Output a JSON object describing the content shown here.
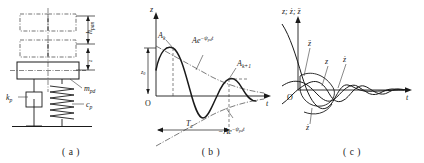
{
  "figure": {
    "panels": [
      {
        "id": "a",
        "caption": "( a )",
        "name": "pantograph-lumped-mass-model",
        "labels": {
          "height_dim": "h",
          "height_dim_sub": "pan",
          "small_dim": "z",
          "mass": "m",
          "mass_sub": "pd",
          "stiffness": "k",
          "stiffness_sub": "p",
          "damping": "c",
          "damping_sub": "p"
        },
        "elements": {
          "contact_wire_grid": "dash-dot catenary grid",
          "mass_block": "pantograph head mass block",
          "spring": "coil spring",
          "damper": "viscous damper",
          "ground": "base line"
        }
      },
      {
        "id": "b",
        "caption": "( b )",
        "name": "damped-free-vibration-response",
        "axes": {
          "y_label": "z",
          "x_label": "t",
          "origin_label": "O"
        },
        "labels": {
          "initial_amplitude": "z",
          "initial_amplitude_sub": "0",
          "peak_k": "A",
          "peak_k_sub": "k",
          "peak_k1": "A",
          "peak_k1_sub": "k+1",
          "upper_envelope_pre": "Ae",
          "upper_envelope_exp": "−ψ",
          "upper_envelope_exp_sub": "pd",
          "upper_envelope_exp_tail": "t",
          "lower_envelope_pre": "−Ae",
          "period": "T",
          "period_sub": "z"
        },
        "curves": [
          "damped-oscillation",
          "upper-exponential-envelope",
          "lower-exponential-envelope"
        ]
      },
      {
        "id": "c",
        "caption": "( c )",
        "name": "displacement-velocity-acceleration-response",
        "axes": {
          "y_label_parts": [
            "z",
            "ż",
            "z̈"
          ],
          "y_label_joined": "z; ż; z̈",
          "x_label": "t",
          "origin_label": "O"
        },
        "labels": {
          "acceleration": "z̈",
          "displacement": "z",
          "velocity": "ż",
          "velocity_lower": "ż"
        },
        "curves": [
          "displacement-curve",
          "velocity-curve",
          "acceleration-curve"
        ]
      }
    ],
    "colors": {
      "line": "#1a1a1a",
      "dash_dot": "#555555",
      "thin": "#333333",
      "background": "#ffffff"
    }
  }
}
